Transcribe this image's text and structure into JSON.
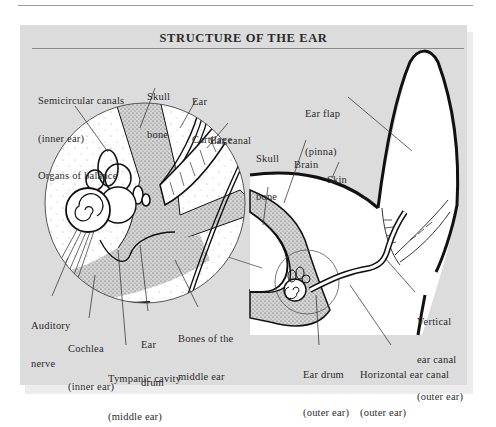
{
  "figure": {
    "title": "STRUCTURE OF THE EAR",
    "colors": {
      "panel_bg": "#dcdcdc",
      "ink": "#1a1a1a",
      "text": "#2a2a2a",
      "tissue_white": "#ffffff"
    }
  },
  "labels": {
    "semicircular": {
      "line1": "Semicircular canals",
      "line2": "(inner ear)",
      "line3": "Organs of balance"
    },
    "skull_bone_left": {
      "line1": "Skull",
      "line2": "bone"
    },
    "ear_cartilage": {
      "line1": "Ear",
      "line2": "Cartilage"
    },
    "ear_canal": {
      "line1": "Ear canal"
    },
    "skull_bone_right": {
      "line1": "Skull",
      "line2": "bone"
    },
    "brain": {
      "line1": "Brain"
    },
    "skin": {
      "line1": "Skin"
    },
    "ear_flap": {
      "line1": "Ear flap",
      "line2": "(pinna)"
    },
    "auditory_nerve": {
      "line1": "Auditory",
      "line2": "nerve"
    },
    "cochlea": {
      "line1": "Cochlea",
      "line2": "(inner ear)"
    },
    "ear_drum_left": {
      "line1": "Ear",
      "line2": "drum"
    },
    "bones_middle": {
      "line1": "Bones of the",
      "line2": "middle ear"
    },
    "tympanic": {
      "line1": "Tympanic cavity",
      "line2": "(middle ear)"
    },
    "vertical_canal": {
      "line1": "Vertical",
      "line2": "ear canal",
      "line3": "(outer ear)"
    },
    "ear_drum_right": {
      "line1": "Ear drum",
      "line2": "(outer ear)"
    },
    "horizontal_canal": {
      "line1": "Horizontal ear canal",
      "line2": "(outer ear)"
    }
  }
}
